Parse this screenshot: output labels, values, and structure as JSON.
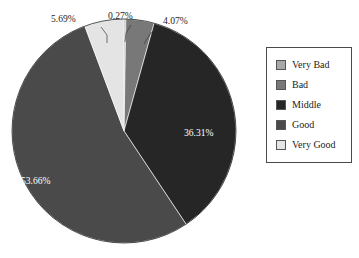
{
  "chart_data": {
    "type": "pie",
    "title": "",
    "labels": [
      "Very Bad",
      "Bad",
      "Middle",
      "Good",
      "Very Good"
    ],
    "values": [
      0.27,
      4.07,
      36.31,
      53.66,
      5.69
    ],
    "value_labels": [
      "0.27%",
      "4.07%",
      "36.31%",
      "53.66%",
      "5.69%"
    ],
    "colors": [
      "#a8a8a8",
      "#787878",
      "#262626",
      "#4a4a4a",
      "#e4e4e4"
    ],
    "label_positions": [
      "outside",
      "outside",
      "inside",
      "inside",
      "outside"
    ],
    "start_angle_deg": 0,
    "direction": "clockwise",
    "legend": {
      "position": "right",
      "entries": [
        {
          "label": "Very Bad",
          "color": "#a8a8a8"
        },
        {
          "label": "Bad",
          "color": "#787878"
        },
        {
          "label": "Middle",
          "color": "#262626"
        },
        {
          "label": "Good",
          "color": "#4a4a4a"
        },
        {
          "label": "Very Good",
          "color": "#e4e4e4"
        }
      ]
    },
    "grid": false,
    "xlabel": "",
    "ylabel": ""
  },
  "callouts": {
    "very_good": "5.69%",
    "very_bad": "0.27%",
    "bad": "4.07%"
  },
  "inline": {
    "middle": "36.31%",
    "good": "53.66%"
  }
}
